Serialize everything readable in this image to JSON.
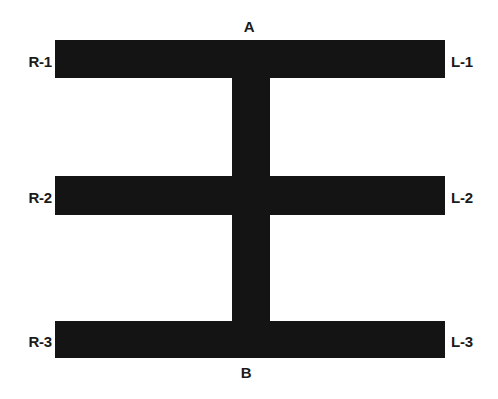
{
  "figure": {
    "background_color": "#ffffff",
    "ink_color": "#141414",
    "labels": {
      "top": "A",
      "bottom": "B",
      "left": [
        "R-1",
        "R-2",
        "R-3"
      ],
      "right": [
        "L-1",
        "L-2",
        "L-3"
      ]
    }
  },
  "diagram": {
    "rungs": [
      {
        "left_label": "R-1",
        "right_label": "L-1"
      },
      {
        "left_label": "R-2",
        "right_label": "L-2"
      },
      {
        "left_label": "R-3",
        "right_label": "L-3"
      }
    ],
    "spine": {
      "top_label": "A",
      "bottom_label": "B"
    }
  }
}
